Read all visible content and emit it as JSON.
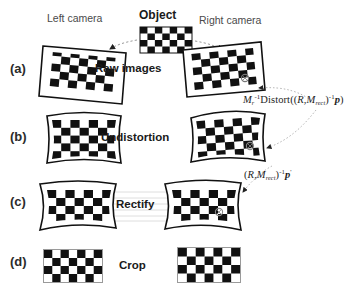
{
  "figure": {
    "title_labels": {
      "object": "Object",
      "left_camera": "Left camera",
      "right_camera": "Right camera"
    },
    "rows": [
      {
        "tag": "(a)",
        "stage": "Raw images"
      },
      {
        "tag": "(b)",
        "stage": "Undistortion"
      },
      {
        "tag": "(c)",
        "stage": "Rectify"
      },
      {
        "tag": "(d)",
        "stage": "Crop"
      }
    ],
    "formulas": [
      {
        "id": "formula-undistort",
        "plain": "M_r^-1 Distort((R, M_rect)^-1 p)",
        "parts": {
          "m": "M",
          "m_sub": "r",
          "m_sup": "-1",
          "fn": "Distort",
          "open": "(",
          "r": "R",
          "comma": ",",
          "mm": "M",
          "mm_sub": "rect",
          "mm_sup": "-1",
          "p": "p",
          "close": ")"
        }
      },
      {
        "id": "formula-rectify",
        "plain": "(R, M_rect)^-1 p'",
        "parts": {
          "open": "(",
          "r": "R",
          "comma": ",",
          "mm": "M",
          "mm_sub": "rect",
          "mm_sup": "-1",
          "p": "p",
          "prime": "'",
          "close": ")"
        }
      }
    ],
    "colors": {
      "ink": "#1a1a1a",
      "label_gray": "#4a4a4a",
      "background": "#ffffff",
      "arrow_gray": "#8c8c8c",
      "epipolar_line": "#d9d9d9"
    },
    "checkerboards": {
      "object": {
        "cols": 7,
        "rows": 4,
        "name": "object-checkerboard"
      },
      "raw_left": {
        "cols": 7,
        "rows": 5,
        "name": "raw-left-checkerboard"
      },
      "raw_right": {
        "cols": 7,
        "rows": 5,
        "name": "raw-right-checkerboard"
      },
      "undistort_left": {
        "cols": 7,
        "rows": 5,
        "name": "undistorted-left-checkerboard"
      },
      "undistort_right": {
        "cols": 7,
        "rows": 5,
        "name": "undistorted-right-checkerboard"
      },
      "rectify_left": {
        "cols": 7,
        "rows": 4,
        "name": "rectified-left-checkerboard"
      },
      "rectify_right": {
        "cols": 7,
        "rows": 4,
        "name": "rectified-right-checkerboard"
      },
      "crop_left": {
        "cols": 7,
        "rows": 4,
        "name": "cropped-left-checkerboard"
      },
      "crop_right": {
        "cols": 7,
        "rows": 4,
        "name": "cropped-right-checkerboard"
      }
    }
  }
}
